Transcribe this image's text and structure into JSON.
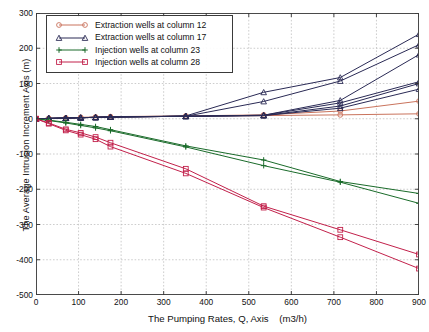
{
  "chart_data": {
    "type": "line",
    "title": "",
    "xlabel": "The Pumping Rates, Q, Axis    (m3/h)",
    "ylabel": "The Average Intrusion Increment Axis (m)",
    "xlim": [
      0,
      900
    ],
    "ylim": [
      -500,
      300
    ],
    "xticks": [
      0,
      100,
      200,
      300,
      400,
      500,
      600,
      700,
      800,
      900
    ],
    "yticks": [
      300,
      200,
      100,
      0,
      -100,
      -200,
      -300,
      -400,
      -500
    ],
    "grid": true,
    "legend_position": "upper-left-inside",
    "x": [
      0,
      30,
      70,
      105,
      140,
      175,
      352,
      535,
      715,
      900
    ],
    "series": [
      {
        "name": "Extraction wells at column 12",
        "group": "extraction-12",
        "marker": "circle",
        "color": "#c9735c",
        "values": [
          0,
          1,
          2,
          3,
          4,
          5,
          7,
          9,
          11,
          14
        ]
      },
      {
        "name": "Extraction wells at column 12",
        "group": "extraction-12",
        "marker": "circle",
        "color": "#c9735c",
        "values": [
          0,
          1,
          2,
          4,
          5,
          6,
          8,
          11,
          22,
          50
        ]
      },
      {
        "name": "Extraction wells at column 17",
        "group": "extraction-17",
        "marker": "triangle",
        "color": "#2a2a55",
        "values": [
          0,
          1,
          2,
          3,
          4,
          5,
          8,
          75,
          117,
          240
        ]
      },
      {
        "name": "Extraction wells at column 17",
        "group": "extraction-17",
        "marker": "triangle",
        "color": "#2a2a55",
        "values": [
          0,
          1,
          2,
          3,
          4,
          5,
          7,
          49,
          107,
          210
        ]
      },
      {
        "name": "Extraction wells at column 17",
        "group": "extraction-17",
        "marker": "triangle",
        "color": "#2a2a55",
        "values": [
          0,
          1,
          2,
          3,
          4,
          5,
          7,
          10,
          52,
          182
        ]
      },
      {
        "name": "Extraction wells at column 17",
        "group": "extraction-17",
        "marker": "triangle",
        "color": "#2a2a55",
        "values": [
          0,
          1,
          2,
          3,
          4,
          5,
          7,
          10,
          45,
          105
        ]
      },
      {
        "name": "Extraction wells at column 17",
        "group": "extraction-17",
        "marker": "triangle",
        "color": "#2a2a55",
        "values": [
          0,
          1,
          2,
          3,
          4,
          5,
          7,
          9,
          36,
          100
        ]
      },
      {
        "name": "Extraction wells at column 17",
        "group": "extraction-17",
        "marker": "triangle",
        "color": "#2a2a55",
        "values": [
          0,
          1,
          2,
          3,
          4,
          5,
          7,
          9,
          30,
          84
        ]
      },
      {
        "name": "Injection wells at column 23",
        "group": "injection-23",
        "marker": "plus",
        "color": "#1a6b2a",
        "values": [
          0,
          -4,
          -10,
          -16,
          -22,
          -31,
          -77,
          -117,
          -178,
          -212
        ]
      },
      {
        "name": "Injection wells at column 23",
        "group": "injection-23",
        "marker": "plus",
        "color": "#1a6b2a",
        "values": [
          0,
          -5,
          -12,
          -19,
          -26,
          -34,
          -80,
          -133,
          -180,
          -240
        ]
      },
      {
        "name": "Injection wells at column 28",
        "group": "injection-28",
        "marker": "square",
        "color": "#c2214b",
        "values": [
          0,
          -12,
          -30,
          -40,
          -52,
          -68,
          -142,
          -248,
          -315,
          -385
        ]
      },
      {
        "name": "Injection wells at column 28",
        "group": "injection-28",
        "marker": "square",
        "color": "#c2214b",
        "values": [
          0,
          -14,
          -33,
          -45,
          -58,
          -79,
          -155,
          -252,
          -336,
          -425
        ]
      }
    ],
    "legend": [
      {
        "label": "Extraction wells at column 12",
        "marker": "circle",
        "color": "#c9735c"
      },
      {
        "label": "Extraction wells at column 17",
        "marker": "triangle",
        "color": "#2a2a55"
      },
      {
        "label": "Injection wells at column 23",
        "marker": "plus",
        "color": "#1a6b2a"
      },
      {
        "label": "Injection wells at column 28",
        "marker": "square",
        "color": "#c2214b"
      }
    ]
  }
}
